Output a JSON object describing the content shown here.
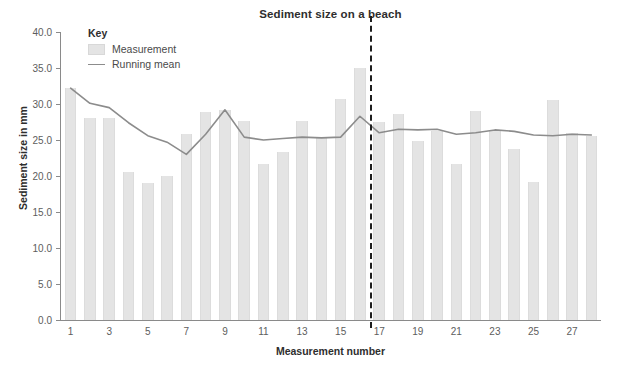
{
  "chart_data": {
    "type": "bar",
    "title": "Sediment size on a beach",
    "xlabel": "Measurement number",
    "ylabel": "Sediment size in mm",
    "ylim": [
      0.0,
      40.0
    ],
    "y_ticks": [
      "0.0",
      "5.0",
      "10.0",
      "15.0",
      "20.0",
      "25.0",
      "30.0",
      "35.0",
      "40.0"
    ],
    "y_tick_values": [
      0.0,
      5.0,
      10.0,
      15.0,
      20.0,
      25.0,
      30.0,
      35.0,
      40.0
    ],
    "x_ticks": [
      "1",
      "3",
      "5",
      "7",
      "9",
      "11",
      "13",
      "15",
      "17",
      "19",
      "21",
      "23",
      "25",
      "27"
    ],
    "x_tick_values": [
      1,
      3,
      5,
      7,
      9,
      11,
      13,
      15,
      17,
      19,
      21,
      23,
      25,
      27
    ],
    "categories": [
      1,
      2,
      3,
      4,
      5,
      6,
      7,
      8,
      9,
      10,
      11,
      12,
      13,
      14,
      15,
      16,
      17,
      18,
      19,
      20,
      21,
      22,
      23,
      24,
      25,
      26,
      27,
      28
    ],
    "grid": false,
    "legend_position": "top-left-inside",
    "series": [
      {
        "name": "Measurement",
        "type": "bar",
        "color": "#e4e4e4",
        "values": [
          32.2,
          28.0,
          28.1,
          20.5,
          19.0,
          20.0,
          25.8,
          28.9,
          29.2,
          27.7,
          21.7,
          23.3,
          27.6,
          25.4,
          30.7,
          35.0,
          27.5,
          28.6,
          24.9,
          26.3,
          21.6,
          29.0,
          26.2,
          23.8,
          19.1,
          30.5,
          26.0,
          25.5
        ]
      },
      {
        "name": "Running mean",
        "type": "line",
        "color": "#8c8c8c",
        "values": [
          32.2,
          30.1,
          29.5,
          27.4,
          25.6,
          24.7,
          23.0,
          25.8,
          29.2,
          25.4,
          25.0,
          25.2,
          25.4,
          25.3,
          25.4,
          28.3,
          26.0,
          26.5,
          26.4,
          26.5,
          25.8,
          26.0,
          26.4,
          26.2,
          25.7,
          25.6,
          25.8,
          25.7
        ]
      }
    ],
    "annotations": [
      {
        "name": "section-divider",
        "type": "vertical-dashed-line",
        "x_between": [
          16,
          17
        ],
        "color": "#1d1d1d"
      }
    ]
  },
  "legend": {
    "title": "Key",
    "items": [
      {
        "label": "Measurement",
        "swatch": "bar"
      },
      {
        "label": "Running mean",
        "swatch": "line"
      }
    ]
  },
  "caption": {
    "text": ""
  }
}
